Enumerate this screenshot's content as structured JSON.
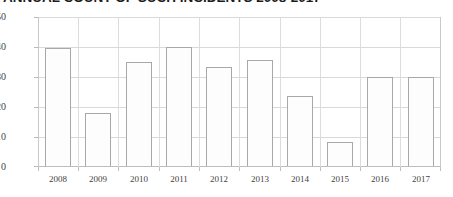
{
  "chart_data": {
    "type": "bar",
    "title": "ANNUAL COUNT OF SUCH INCIDENTS 2008-2017",
    "title_truncated": true,
    "subtitle": "",
    "xlabel": "",
    "ylabel": "",
    "categories": [
      "2008",
      "2009",
      "2010",
      "2011",
      "2012",
      "2013",
      "2014",
      "2015",
      "2016",
      "2017"
    ],
    "values": [
      39.5,
      17.7,
      35,
      39.8,
      33.3,
      35.5,
      23.4,
      8,
      29.7,
      29.7
    ],
    "ylim": [
      0,
      50
    ],
    "ytick_values": [
      0,
      10,
      20,
      30,
      40,
      50
    ],
    "ytick_labels": [
      "0",
      "10",
      "20",
      "30",
      "40",
      "50"
    ],
    "grid": "horizontal-and-vertical",
    "legend": "none",
    "bar_face_color": "#fdfdfd",
    "bar_edge_color": "#a8a8a8",
    "grid_color": "#d9d9d9",
    "axis_color": "#bdbdbd",
    "text_color": "#3f3f3f"
  }
}
